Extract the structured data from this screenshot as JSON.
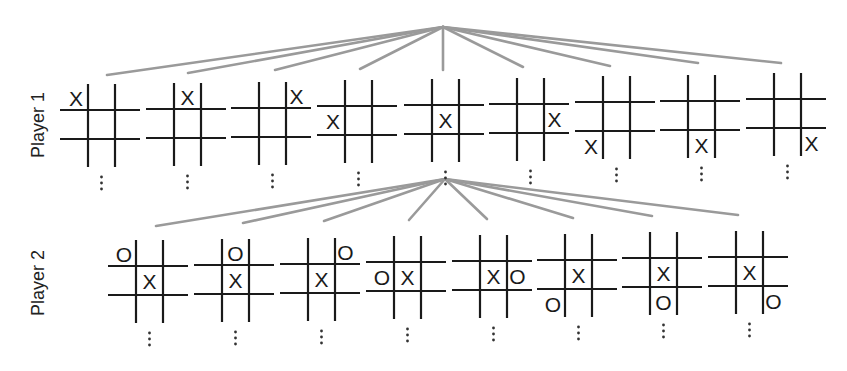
{
  "diagram": {
    "colors": {
      "edge": "#9a9a9a",
      "grid": "#1a1a1a",
      "background": "#ffffff"
    },
    "levels": [
      {
        "label": "Player 1",
        "label_pos": [
          38,
          125
        ],
        "apex": [
          443,
          27
        ],
        "edge_targets": [
          [
            107,
            75
          ],
          [
            188,
            73
          ],
          [
            275,
            70
          ],
          [
            360,
            69
          ],
          [
            443,
            70
          ],
          [
            523,
            67
          ],
          [
            610,
            66
          ],
          [
            698,
            63
          ],
          [
            781,
            63
          ]
        ],
        "boards": [
          {
            "x": 60,
            "y": 110,
            "cells": [
              "X",
              "",
              "",
              "",
              "",
              "",
              "",
              "",
              ""
            ]
          },
          {
            "x": 146,
            "y": 109,
            "cells": [
              "",
              "X",
              "",
              "",
              "",
              "",
              "",
              "",
              ""
            ]
          },
          {
            "x": 231,
            "y": 108,
            "cells": [
              "",
              "",
              "X",
              "",
              "",
              "",
              "",
              "",
              ""
            ]
          },
          {
            "x": 317,
            "y": 106,
            "cells": [
              "",
              "",
              "",
              "X",
              "",
              "",
              "",
              "",
              ""
            ]
          },
          {
            "x": 404,
            "y": 105,
            "cells": [
              "",
              "",
              "",
              "",
              "X",
              "",
              "",
              "",
              ""
            ]
          },
          {
            "x": 489,
            "y": 104,
            "cells": [
              "",
              "",
              "",
              "",
              "",
              "X",
              "",
              "",
              ""
            ]
          },
          {
            "x": 575,
            "y": 102,
            "cells": [
              "",
              "",
              "",
              "",
              "",
              "",
              "X",
              "",
              ""
            ]
          },
          {
            "x": 660,
            "y": 101,
            "cells": [
              "",
              "",
              "",
              "",
              "",
              "",
              "",
              "X",
              ""
            ]
          },
          {
            "x": 746,
            "y": 99,
            "cells": [
              "",
              "",
              "",
              "",
              "",
              "",
              "",
              "",
              "X"
            ]
          }
        ],
        "continuation": "⋮"
      },
      {
        "label": "Player 2",
        "label_pos": [
          38,
          283
        ],
        "apex": [
          445,
          179
        ],
        "edge_targets": [
          [
            156,
            226
          ],
          [
            243,
            223
          ],
          [
            324,
            221
          ],
          [
            409,
            220
          ],
          [
            487,
            219
          ],
          [
            573,
            218
          ],
          [
            652,
            216
          ],
          [
            738,
            215
          ]
        ],
        "boards": [
          {
            "x": 108,
            "y": 266,
            "cells": [
              "O",
              "",
              "",
              "",
              "X",
              "",
              "",
              "",
              ""
            ]
          },
          {
            "x": 194,
            "y": 265,
            "cells": [
              "",
              "O",
              "",
              "",
              "X",
              "",
              "",
              "",
              ""
            ]
          },
          {
            "x": 280,
            "y": 264,
            "cells": [
              "",
              "",
              "O",
              "",
              "X",
              "",
              "",
              "",
              ""
            ]
          },
          {
            "x": 366,
            "y": 262,
            "cells": [
              "",
              "",
              "",
              "O",
              "X",
              "",
              "",
              "",
              ""
            ]
          },
          {
            "x": 452,
            "y": 261,
            "cells": [
              "",
              "",
              "",
              "",
              "X",
              "O",
              "",
              "",
              ""
            ]
          },
          {
            "x": 537,
            "y": 260,
            "cells": [
              "",
              "",
              "",
              "",
              "X",
              "",
              "O",
              "",
              ""
            ]
          },
          {
            "x": 622,
            "y": 258,
            "cells": [
              "",
              "",
              "",
              "",
              "X",
              "",
              "",
              "O",
              ""
            ]
          },
          {
            "x": 708,
            "y": 257,
            "cells": [
              "",
              "",
              "",
              "",
              "X",
              "",
              "",
              "",
              "O"
            ]
          }
        ],
        "continuation": "⋮"
      }
    ]
  }
}
